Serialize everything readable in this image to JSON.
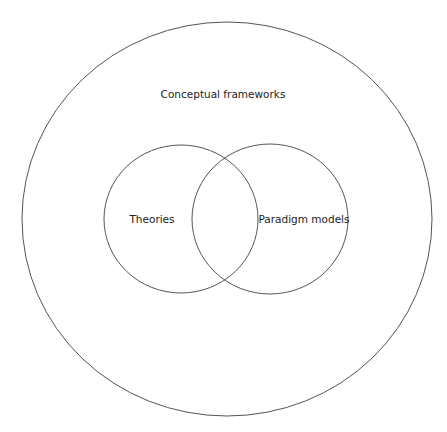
{
  "diagram": {
    "type": "venn",
    "outer": {
      "label": "Conceptual frameworks"
    },
    "sets": [
      {
        "label": "Theories"
      },
      {
        "label": "Paradigm models"
      }
    ],
    "colors": {
      "stroke": "#555555",
      "text": "#222222",
      "background": "#ffffff"
    }
  }
}
